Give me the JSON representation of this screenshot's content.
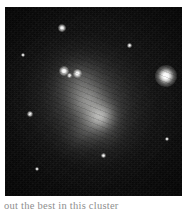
{
  "page": {
    "background_color": "#ffffff",
    "width": 182,
    "height": 213
  },
  "figure": {
    "name": "astronomical-photograph",
    "alt": "Irregular galaxy with dense surrounding star field",
    "background_color": "#050505",
    "bounds": {
      "x": 5,
      "y": 7,
      "width": 177,
      "height": 189
    },
    "objects": [
      {
        "name": "irregular-galaxy",
        "description": "diffuse elongated glow oriented upper-left to lower-right",
        "position": {
          "x": 84,
          "y": 95
        }
      },
      {
        "name": "bright-star-right",
        "description": "prominent star with broad halo",
        "position": {
          "x": 161,
          "y": 69
        }
      },
      {
        "name": "star-top",
        "description": "bright star near the top edge",
        "position": {
          "x": 57,
          "y": 21
        }
      },
      {
        "name": "star-knot-a",
        "description": "bright knot in the upper galaxy body",
        "position": {
          "x": 59,
          "y": 64
        }
      },
      {
        "name": "star-knot-b",
        "description": "bright knot in the upper galaxy body",
        "position": {
          "x": 73,
          "y": 67
        }
      }
    ]
  },
  "caption": {
    "text": "out the best in this cluster",
    "color": "#8e8e8e"
  }
}
